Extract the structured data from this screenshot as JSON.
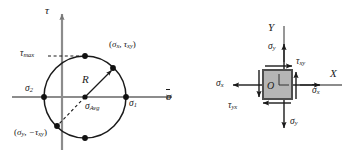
{
  "figure": {
    "colors": {
      "stroke": "#1a1a1a",
      "axis": "#777777",
      "element_fill": "#b3b3b3",
      "element_edge": "#4d4d4d",
      "dashed": "#333333"
    }
  },
  "mohr_circle": {
    "name": "mohr-circle-diagram",
    "axis_tau_label": "τ",
    "axis_sigma_label": "σ",
    "center_label": "σ",
    "center_sub": "Avg",
    "radius_label": "R",
    "tau_max_label": "τ",
    "tau_max_sub": "max",
    "sigma1_label": "σ",
    "sigma1_sub": "1",
    "sigma2_label": "σ",
    "sigma2_sub": "2",
    "point_x_open": "(",
    "point_x_sigma": "σ",
    "point_x_sigma_sub": "x",
    "point_x_comma": ", ",
    "point_x_tau": "τ",
    "point_x_tau_sub": "xy",
    "point_x_close": ")",
    "point_y_open": "(",
    "point_y_sigma": "σ",
    "point_y_sigma_sub": "y",
    "point_y_comma": ",",
    "point_y_tau": "−τ",
    "point_y_tau_sub": "xy",
    "point_y_close": ")",
    "geometry": {
      "center_x": 85,
      "center_y": 97,
      "radius": 41,
      "point_x_px": [
        113,
        68
      ],
      "point_y_px": [
        57,
        126
      ],
      "sigma1_px": [
        126,
        97
      ],
      "sigma2_px": [
        44,
        97
      ],
      "tau_max_px": [
        85,
        56
      ],
      "tau_min_px": [
        85,
        138
      ]
    }
  },
  "stress_element": {
    "name": "stress-element-diagram",
    "axis_y_label": "Y",
    "axis_x_label": "X",
    "sigma_y_top": "σ",
    "sigma_y_top_sub": "y",
    "sigma_y_bottom": "σ",
    "sigma_y_bottom_sub": "y",
    "sigma_x_left": "σ",
    "sigma_x_left_sub": "x",
    "sigma_x_right": "σ",
    "sigma_x_right_sub": "x",
    "tau_xy": "τ",
    "tau_xy_sub": "xy",
    "tau_yx": "τ",
    "tau_yx_sub": "yx",
    "origin_label": "O",
    "geometry": {
      "square_left": 263,
      "square_top": 70,
      "square_size": 29
    }
  }
}
